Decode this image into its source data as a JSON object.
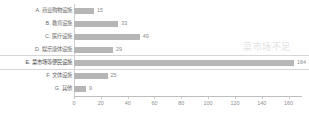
{
  "watermark": "菜市场不足",
  "chart_data": {
    "type": "bar",
    "orientation": "horizontal",
    "title": "",
    "xlabel": "",
    "ylabel": "",
    "xlim": [
      0,
      170
    ],
    "grid": false,
    "legend": "none",
    "xticks": [
      0,
      20,
      40,
      60,
      80,
      100,
      120,
      140,
      160
    ],
    "categories": [
      "A. 商业购物设施",
      "B. 教育设施",
      "C. 医疗设施",
      "D. 娱乐康体设施",
      "E. 菜市场等便民设施",
      "F. 文体设施",
      "G. 其他"
    ],
    "values": [
      15,
      33,
      49,
      29,
      164,
      25,
      9
    ],
    "selected_index": 4,
    "bar_color": "#b6b6b6"
  }
}
